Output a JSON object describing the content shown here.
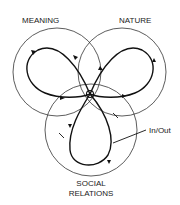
{
  "diagram": {
    "circles": [
      {
        "id": "meaning",
        "label": "MEANING"
      },
      {
        "id": "nature",
        "label": "NATURE"
      },
      {
        "id": "social",
        "label_line1": "SOCIAL",
        "label_line2": "RELATIONS"
      }
    ],
    "annotation": "In/Out",
    "colors": {
      "stroke": "#111111",
      "background": "#ffffff"
    }
  }
}
